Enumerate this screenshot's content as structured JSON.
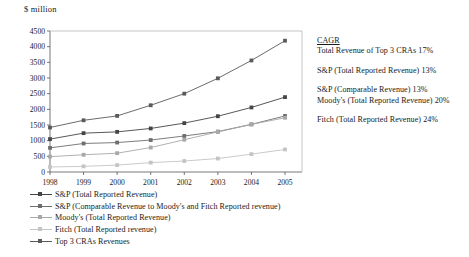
{
  "axis_unit_label": "$ million",
  "chart_data": {
    "type": "line",
    "title": "",
    "subtitle": "",
    "xlabel": "",
    "ylabel": "$ million",
    "categories": [
      "1998",
      "1999",
      "2000",
      "2001",
      "2002",
      "2003",
      "2004",
      "2005"
    ],
    "x": [
      1998,
      1999,
      2000,
      2001,
      2002,
      2003,
      2004,
      2005
    ],
    "ylim": [
      0,
      4500
    ],
    "ytick_values": [
      0,
      500,
      1000,
      1500,
      2000,
      2500,
      3000,
      3500,
      4000,
      4500
    ],
    "ytick_labels": [
      "0",
      "500",
      "1000",
      "1500",
      "2000",
      "2500",
      "3000",
      "3500",
      "4000",
      "4500"
    ],
    "grid": false,
    "legend_position": "bottom-left",
    "series": [
      {
        "name": "S&P (Total Reported Revenue)",
        "color": "#454545",
        "marker": "square",
        "values": [
          1050,
          1240,
          1280,
          1390,
          1560,
          1780,
          2060,
          2390
        ]
      },
      {
        "name": "S&P (Comparable Revenue to Moody's and Fitch Reported revenue)",
        "color": "#6e6e6e",
        "marker": "square",
        "values": [
          770,
          910,
          940,
          1020,
          1150,
          1290,
          1520,
          1790
        ]
      },
      {
        "name": "Moody's (Total Reported Revenue)",
        "color": "#a8a8a8",
        "marker": "square",
        "values": [
          490,
          550,
          600,
          780,
          1030,
          1280,
          1520,
          1730
        ]
      },
      {
        "name": "Fitch (Total Reported revenue)",
        "color": "#c4c4c4",
        "marker": "square",
        "values": [
          160,
          180,
          220,
          300,
          350,
          430,
          570,
          720
        ]
      },
      {
        "name": "Top 3 CRAs Revenues",
        "color": "#5a5a5a",
        "marker": "square",
        "values": [
          1420,
          1650,
          1790,
          2130,
          2500,
          2990,
          3560,
          4190
        ]
      }
    ],
    "annotations": [
      {
        "id": "cagr-heading",
        "lines": [
          "CAGR",
          "Total Revenue of Top 3 CRAs 17%"
        ]
      },
      {
        "id": "sp-total-cagr",
        "lines": [
          "S&P (Total Reported Revenue) 13%"
        ]
      },
      {
        "id": "sp-comparable-moodys-cagr",
        "lines": [
          "S&P (Comparable Revenue) 13%",
          "Moody's (Total Reported Revenue) 20%"
        ]
      },
      {
        "id": "fitch-cagr",
        "lines": [
          "Fitch (Total Reported Revenue) 24%"
        ]
      }
    ]
  },
  "legend": {
    "items": [
      {
        "label": "S&P (Total Reported Revenue)",
        "color": "#454545"
      },
      {
        "label": "S&P (Comparable Revenue to Moody's and Fitch Reported revenue)",
        "color": "#6e6e6e"
      },
      {
        "label": "Moody's (Total Reported Revenue)",
        "color": "#a8a8a8"
      },
      {
        "label": "Fitch (Total Reported revenue)",
        "color": "#c4c4c4"
      },
      {
        "label": "Top 3 CRAs Revenues",
        "color": "#5a5a5a"
      }
    ]
  },
  "annotation_text": {
    "cagr_title": "CAGR",
    "top3_line": "Total Revenue of Top 3 CRAs 17%",
    "sp_total_line": "S&P (Total Reported Revenue) 13%",
    "sp_comparable_line": "S&P (Comparable Revenue) 13%",
    "moodys_line": "Moody's (Total Reported Revenue) 20%",
    "fitch_line": "Fitch (Total Reported Revenue) 24%"
  }
}
